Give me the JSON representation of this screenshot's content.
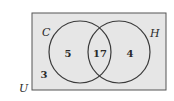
{
  "diagram": {
    "type": "venn",
    "universe_label": "U",
    "sets": [
      {
        "name": "C",
        "only_count": "5"
      },
      {
        "name": "H",
        "only_count": "4"
      }
    ],
    "intersection_count": "17",
    "outside_count": "3",
    "colors": {
      "background": "#e6e6e6",
      "stroke": "#3a3a3a"
    }
  }
}
